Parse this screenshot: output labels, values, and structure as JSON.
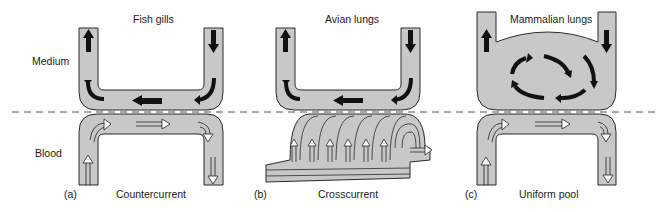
{
  "labels": {
    "medium": "Medium",
    "blood": "Blood"
  },
  "panels": [
    {
      "letter": "(a)",
      "title": "Fish gills",
      "caption": "Countercurrent"
    },
    {
      "letter": "(b)",
      "title": "Avian lungs",
      "caption": "Crosscurrent"
    },
    {
      "letter": "(c)",
      "title": "Mammalian lungs",
      "caption": "Uniform pool"
    }
  ],
  "colors": {
    "tube_fill": "#c8c8c8",
    "outline": "#2a2a2a",
    "arrow": "#111111",
    "background": "#ffffff",
    "dashed_line": "#555555"
  }
}
